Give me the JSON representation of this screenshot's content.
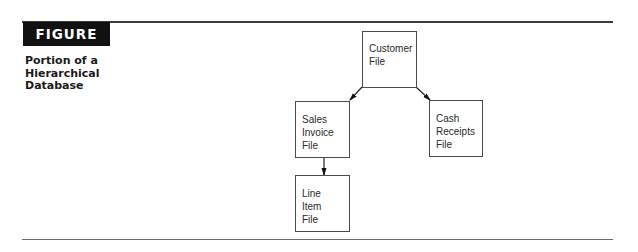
{
  "figure": {
    "label": "FIGURE 4.9",
    "caption_lines": [
      "Portion of a",
      "Hierarchical",
      "Database"
    ]
  },
  "diagram": {
    "type": "hierarchy",
    "nodes": [
      {
        "id": "customer",
        "lines": [
          "Customer",
          "File"
        ]
      },
      {
        "id": "sales_invoice",
        "lines": [
          "Sales",
          "Invoice",
          "File"
        ]
      },
      {
        "id": "cash_receipts",
        "lines": [
          "Cash",
          "Receipts",
          "File"
        ]
      },
      {
        "id": "line_item",
        "lines": [
          "Line",
          "Item",
          "File"
        ]
      }
    ],
    "edges": [
      {
        "from": "customer",
        "to": "sales_invoice"
      },
      {
        "from": "customer",
        "to": "cash_receipts"
      },
      {
        "from": "sales_invoice",
        "to": "line_item"
      }
    ]
  },
  "colors": {
    "label_bg": "#111111",
    "label_text": "#ffffff",
    "line": "#3a3a3a"
  }
}
